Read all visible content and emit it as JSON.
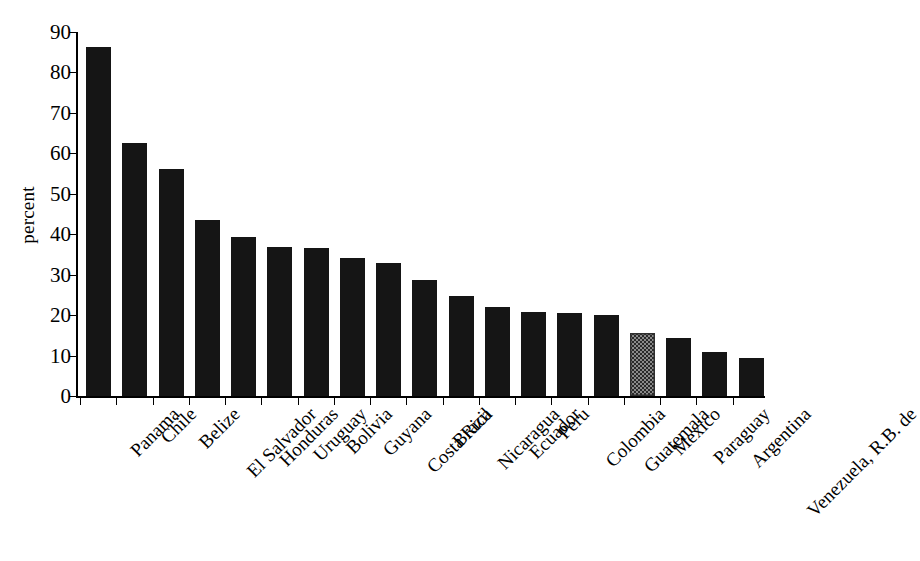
{
  "chart_data": {
    "type": "bar",
    "title": "",
    "subtitle": "",
    "xlabel": "",
    "ylabel": "percent",
    "ylim": [
      0,
      90
    ],
    "ytick_step": 10,
    "yticks": [
      0,
      10,
      20,
      30,
      40,
      50,
      60,
      70,
      80,
      90
    ],
    "grid": false,
    "legend": null,
    "categories": [
      "Panama",
      "Chile",
      "Belize",
      "El Salvador",
      "Honduras",
      "Uruguay",
      "Bolivia",
      "Guyana",
      "Costa Rica",
      "Brazil",
      "Nicaragua",
      "Ecuador",
      "Peru",
      "Colombia",
      "Guatemala",
      "Mexico",
      "Paraguay",
      "Argentina",
      "Venezuela, R.B. de"
    ],
    "values": [
      86.2,
      62.5,
      56.2,
      43.4,
      39.2,
      36.8,
      36.5,
      34.1,
      32.8,
      28.8,
      24.7,
      22.0,
      20.7,
      20.5,
      20.1,
      15.5,
      14.4,
      10.9,
      9.4
    ],
    "highlight_index": 15,
    "highlight_label": "Mexico",
    "bar_color": "#151515",
    "highlight_color": "#8a8a8a",
    "background_color": "#ffffff",
    "axis_color": "#000000"
  }
}
